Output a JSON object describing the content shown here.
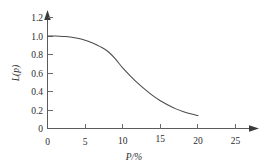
{
  "chart_data": {
    "type": "line",
    "title": "",
    "subtitle": "",
    "xlabel": "P/%",
    "ylabel": "L(p)",
    "xlim": [
      0,
      25
    ],
    "ylim": [
      0,
      1.2
    ],
    "grid": false,
    "legend": null,
    "legend_position": "none",
    "x_ticks": [
      "0",
      "5",
      "10",
      "15",
      "20",
      "25"
    ],
    "x_tick_values": [
      0,
      5,
      10,
      15,
      20,
      25
    ],
    "y_ticks": [
      "0",
      "0.2",
      "0.4",
      "0.6",
      "0.8",
      "1.0",
      "1.2"
    ],
    "y_tick_values": [
      0,
      0.2,
      0.4,
      0.6,
      0.8,
      1.0,
      1.2
    ],
    "series": [
      {
        "name": "L(p)",
        "color": "#4a4a4a",
        "x": [
          0,
          1,
          2,
          3,
          4,
          5,
          6,
          7,
          8,
          9,
          10,
          11,
          12,
          13,
          14,
          15,
          16,
          17,
          18,
          19,
          20
        ],
        "values": [
          1.0,
          1.0,
          0.995,
          0.99,
          0.975,
          0.955,
          0.925,
          0.885,
          0.835,
          0.755,
          0.655,
          0.57,
          0.49,
          0.42,
          0.355,
          0.3,
          0.255,
          0.215,
          0.185,
          0.16,
          0.14
        ]
      }
    ],
    "annotations": [],
    "curve_start": {
      "x": 0,
      "y": 1.0
    },
    "curve_end": {
      "x": 20,
      "y": 0.14
    },
    "axis_arrows": {
      "x_axis": true,
      "y_axis": true
    },
    "background_color": "#ffffff",
    "axis_color": "#5b5b5b"
  },
  "figure": {
    "x_axis_title": "P/%",
    "y_axis_title": "L(p)"
  }
}
